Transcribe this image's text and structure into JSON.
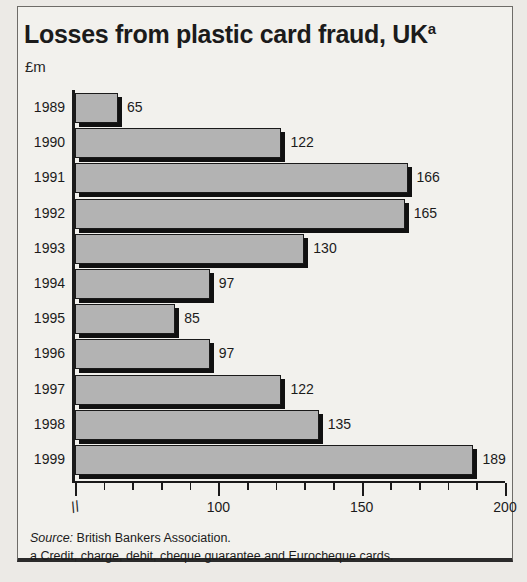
{
  "figure": {
    "title": "Losses from plastic card fraud, UK",
    "title_superscript": "a",
    "unit_label": "£m"
  },
  "footnotes": {
    "source_prefix": "Source:",
    "source_text": "British Bankers Association.",
    "note_a": "a Credit, charge, debit, cheque guarantee and Eurocheque cards."
  },
  "colors": {
    "bar_fill": "#b3b3b3",
    "bar_outline": "#1a1a1a",
    "background": "#f2f1ed",
    "text": "#1b1b1b"
  },
  "chart_data": {
    "type": "bar",
    "orientation": "horizontal",
    "title": "Losses from plastic card fraud, UK",
    "xlabel": "",
    "ylabel": "£m",
    "categories": [
      "1989",
      "1990",
      "1991",
      "1992",
      "1993",
      "1994",
      "1995",
      "1996",
      "1997",
      "1998",
      "1999"
    ],
    "values": [
      65,
      122,
      166,
      165,
      130,
      97,
      85,
      97,
      122,
      135,
      189
    ],
    "value_labels": [
      "65",
      "122",
      "166",
      "165",
      "130",
      "97",
      "85",
      "97",
      "122",
      "135",
      "189"
    ],
    "xlim": [
      50,
      200
    ],
    "axis_break": true,
    "axis_break_symbol": "//",
    "major_ticks": [
      100,
      150,
      200
    ],
    "major_tick_labels": [
      "100",
      "150",
      "200"
    ],
    "minor_tick_step": 10,
    "grid": false,
    "legend": null
  }
}
